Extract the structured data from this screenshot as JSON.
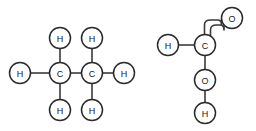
{
  "figure": {
    "background_color": "#ffffff",
    "bond_color": "#3a3a3a",
    "atom_stroke_color": "#2b2b2b",
    "atom_fill_color": "#ffffff",
    "label_color": "#1a1a1a",
    "width": 256,
    "height": 131
  },
  "molecules": [
    {
      "name": "ethane",
      "formula": "C2H6",
      "atoms": [
        {
          "id": "L-H-left",
          "element": "H",
          "label": "H",
          "cx": 20,
          "cy": 73,
          "r": 10.5
        },
        {
          "id": "L-C1",
          "element": "C",
          "label": "C",
          "cx": 60,
          "cy": 73,
          "r": 10.5
        },
        {
          "id": "L-C2",
          "element": "C",
          "label": "C",
          "cx": 92,
          "cy": 73,
          "r": 10.5
        },
        {
          "id": "L-H-top1",
          "element": "H",
          "label": "H",
          "cx": 60,
          "cy": 38,
          "r": 10.5
        },
        {
          "id": "L-H-top2",
          "element": "H",
          "label": "H",
          "cx": 92,
          "cy": 38,
          "r": 10.5
        },
        {
          "id": "L-H-bot1",
          "element": "H",
          "label": "H",
          "cx": 60,
          "cy": 110,
          "r": 10.5
        },
        {
          "id": "L-H-bot2",
          "element": "H",
          "label": "H",
          "cx": 92,
          "cy": 110,
          "r": 10.5
        },
        {
          "id": "L-H-right",
          "element": "H",
          "label": "H",
          "cx": 124,
          "cy": 73,
          "r": 10.5
        }
      ],
      "bonds": [
        {
          "from": "L-H-left",
          "to": "L-C1",
          "order": 1,
          "style": "straight"
        },
        {
          "from": "L-C1",
          "to": "L-C2",
          "order": 1,
          "style": "straight"
        },
        {
          "from": "L-C1",
          "to": "L-H-top1",
          "order": 1,
          "style": "straight"
        },
        {
          "from": "L-C1",
          "to": "L-H-bot1",
          "order": 1,
          "style": "straight"
        },
        {
          "from": "L-C2",
          "to": "L-H-top2",
          "order": 1,
          "style": "straight"
        },
        {
          "from": "L-C2",
          "to": "L-H-bot2",
          "order": 1,
          "style": "straight"
        },
        {
          "from": "L-C2",
          "to": "L-H-right",
          "order": 1,
          "style": "straight"
        }
      ]
    },
    {
      "name": "formic-acid",
      "formula": "HCOOH",
      "atoms": [
        {
          "id": "R-H-left",
          "element": "H",
          "label": "H",
          "cx": 168,
          "cy": 45,
          "r": 10.5
        },
        {
          "id": "R-C",
          "element": "C",
          "label": "C",
          "cx": 205,
          "cy": 45,
          "r": 10.5
        },
        {
          "id": "R-O-double",
          "element": "O",
          "label": "O",
          "cx": 232,
          "cy": 18,
          "r": 10.5
        },
        {
          "id": "R-O-single",
          "element": "O",
          "label": "O",
          "cx": 205,
          "cy": 80,
          "r": 10.5
        },
        {
          "id": "R-H-bottom",
          "element": "H",
          "label": "H",
          "cx": 205,
          "cy": 113,
          "r": 10.5
        }
      ],
      "bonds": [
        {
          "from": "R-H-left",
          "to": "R-C",
          "order": 1,
          "style": "straight"
        },
        {
          "from": "R-C",
          "to": "R-O-double",
          "order": 2,
          "style": "curved"
        },
        {
          "from": "R-C",
          "to": "R-O-single",
          "order": 1,
          "style": "straight"
        },
        {
          "from": "R-O-single",
          "to": "R-H-bottom",
          "order": 1,
          "style": "straight"
        }
      ]
    }
  ]
}
